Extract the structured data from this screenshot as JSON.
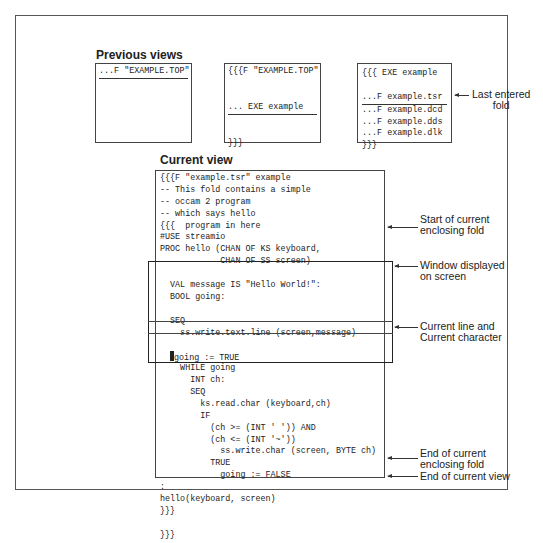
{
  "headings": {
    "previous_views": "Previous views",
    "current_view": "Current view"
  },
  "previous_views": [
    {
      "lines": [
        {
          "text": "...F \"EXAMPLE.TOP\"",
          "underline": true
        }
      ]
    },
    {
      "lines": [
        {
          "text": "{{{F \"EXAMPLE.TOP\"",
          "underline": false
        },
        {
          "text": "",
          "underline": false
        },
        {
          "text": "",
          "underline": false
        },
        {
          "text": "... EXE example",
          "underline": true
        },
        {
          "text": "",
          "underline": false
        },
        {
          "text": "",
          "underline": false
        },
        {
          "text": "}}}",
          "underline": false
        }
      ]
    },
    {
      "lines": [
        {
          "text": "{{{ EXE example",
          "underline": false
        },
        {
          "text": "",
          "underline": false
        },
        {
          "text": "...F example.tsr",
          "underline": true
        },
        {
          "text": "...F example.dcd",
          "underline": false
        },
        {
          "text": "...F example.dds",
          "underline": false
        },
        {
          "text": "...F example.dlk",
          "underline": false
        },
        {
          "text": "}}}",
          "underline": false
        }
      ]
    }
  ],
  "current_view": {
    "lines": [
      "{{{F \"example.tsr\" example",
      "-- This fold contains a simple",
      "-- occam 2 program",
      "-- which says hello",
      "{{{  program in here",
      "#USE streamio",
      "PROC hello (CHAN OF KS keyboard,",
      "            CHAN OF SS screen)",
      "",
      "  VAL message IS \"Hello World!\":",
      "  BOOL going:",
      "",
      "  SEQ",
      "    ss.write.text.line (screen,message)",
      "",
      "",
      "    WHILE going",
      "      INT ch:",
      "      SEQ",
      "        ks.read.char (keyboard,ch)",
      "        IF",
      "          (ch >= (INT ' ')) AND",
      "          (ch <= (INT '~'))",
      "            ss.write.char (screen, BYTE ch)",
      "          TRUE",
      "            going := FALSE",
      ":",
      "hello(keyboard, screen)",
      "}}}",
      "",
      "}}}"
    ],
    "current_line": {
      "index": 15,
      "indent": "  ",
      "text": "going := TRUE"
    }
  },
  "annotations": {
    "last_entered_fold": "Last entered\nfold",
    "start_enclosing": "Start of current\nenclosing fold",
    "window_displayed": "Window displayed\non screen",
    "current_line": "Current line and\nCurrent character",
    "end_enclosing": "End of current\nenclosing fold",
    "end_view": "End of current view"
  }
}
